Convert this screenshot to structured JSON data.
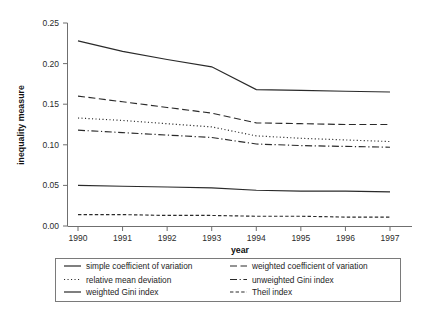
{
  "chart_data": {
    "type": "line",
    "title": "",
    "xlabel": "year",
    "ylabel": "inequality measure",
    "x": [
      1990,
      1991,
      1992,
      1993,
      1994,
      1995,
      1996,
      1997
    ],
    "categories": [
      "1990",
      "1991",
      "1992",
      "1993",
      "1994",
      "1995",
      "1996",
      "1997"
    ],
    "xlim": [
      1990,
      1997
    ],
    "ylim": [
      0.0,
      0.25
    ],
    "yticks": [
      0.0,
      0.05,
      0.1,
      0.15,
      0.2,
      0.25
    ],
    "ytick_labels": [
      "0.00",
      "0.05",
      "0.10",
      "0.15",
      "0.20",
      "0.25"
    ],
    "grid": false,
    "legend_position": "below-axes",
    "series": [
      {
        "name": "simple coefficient of variation",
        "style": "solid",
        "values": [
          0.228,
          0.215,
          0.205,
          0.196,
          0.168,
          0.167,
          0.166,
          0.165
        ]
      },
      {
        "name": "weighted coefficient of variation",
        "style": "dashed",
        "values": [
          0.16,
          0.153,
          0.146,
          0.139,
          0.127,
          0.126,
          0.125,
          0.125
        ]
      },
      {
        "name": "relative mean deviation",
        "style": "dotted",
        "values": [
          0.133,
          0.13,
          0.126,
          0.122,
          0.111,
          0.108,
          0.106,
          0.104
        ]
      },
      {
        "name": "unweighted Gini index",
        "style": "dashdot",
        "values": [
          0.118,
          0.115,
          0.112,
          0.109,
          0.101,
          0.099,
          0.098,
          0.097
        ]
      },
      {
        "name": "weighted Gini index",
        "style": "solid",
        "values": [
          0.05,
          0.049,
          0.048,
          0.047,
          0.044,
          0.043,
          0.043,
          0.042
        ]
      },
      {
        "name": "Theil index",
        "style": "shortdash",
        "values": [
          0.014,
          0.014,
          0.013,
          0.013,
          0.012,
          0.012,
          0.011,
          0.011
        ]
      }
    ],
    "legend": [
      {
        "label": "simple coefficient of variation",
        "style": "solid"
      },
      {
        "label": "weighted coefficient of variation",
        "style": "dashed"
      },
      {
        "label": "relative mean deviation",
        "style": "dotted"
      },
      {
        "label": "unweighted Gini index",
        "style": "dashdot"
      },
      {
        "label": "weighted Gini index",
        "style": "solid"
      },
      {
        "label": "Theil index",
        "style": "shortdash"
      }
    ],
    "colors": {
      "line": "#2a2a2a",
      "axis": "#6f6f6f",
      "background": "#ffffff"
    }
  }
}
